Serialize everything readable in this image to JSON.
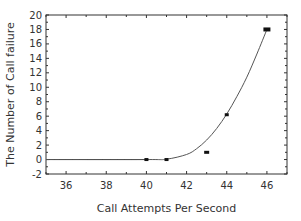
{
  "chart_data": {
    "type": "line",
    "title": "",
    "xlabel": "Call Attempts Per Second",
    "ylabel": "The Number of Call failure",
    "xlim": [
      35,
      47
    ],
    "ylim": [
      -2,
      20
    ],
    "x_ticks": [
      36,
      38,
      40,
      42,
      44,
      46
    ],
    "y_ticks": [
      -2,
      0,
      2,
      4,
      6,
      8,
      10,
      12,
      14,
      16,
      18,
      20
    ],
    "grid": false,
    "legend": "none",
    "series": [
      {
        "name": "measured",
        "style": "markers",
        "points": [
          {
            "x": 40,
            "y": 0
          },
          {
            "x": 41,
            "y": 0
          },
          {
            "x": 43,
            "y": 1
          },
          {
            "x": 44,
            "y": 6.2
          },
          {
            "x": 46,
            "y": 18
          }
        ]
      },
      {
        "name": "fit",
        "style": "line",
        "points": [
          {
            "x": 35,
            "y": 0
          },
          {
            "x": 40,
            "y": 0
          },
          {
            "x": 41,
            "y": 0.05
          },
          {
            "x": 42,
            "y": 0.7
          },
          {
            "x": 42.5,
            "y": 1.5
          },
          {
            "x": 43,
            "y": 2.7
          },
          {
            "x": 43.5,
            "y": 4.3
          },
          {
            "x": 44,
            "y": 6.3
          },
          {
            "x": 44.5,
            "y": 8.7
          },
          {
            "x": 45,
            "y": 11.4
          },
          {
            "x": 45.5,
            "y": 14.6
          },
          {
            "x": 46,
            "y": 18
          }
        ]
      }
    ]
  }
}
